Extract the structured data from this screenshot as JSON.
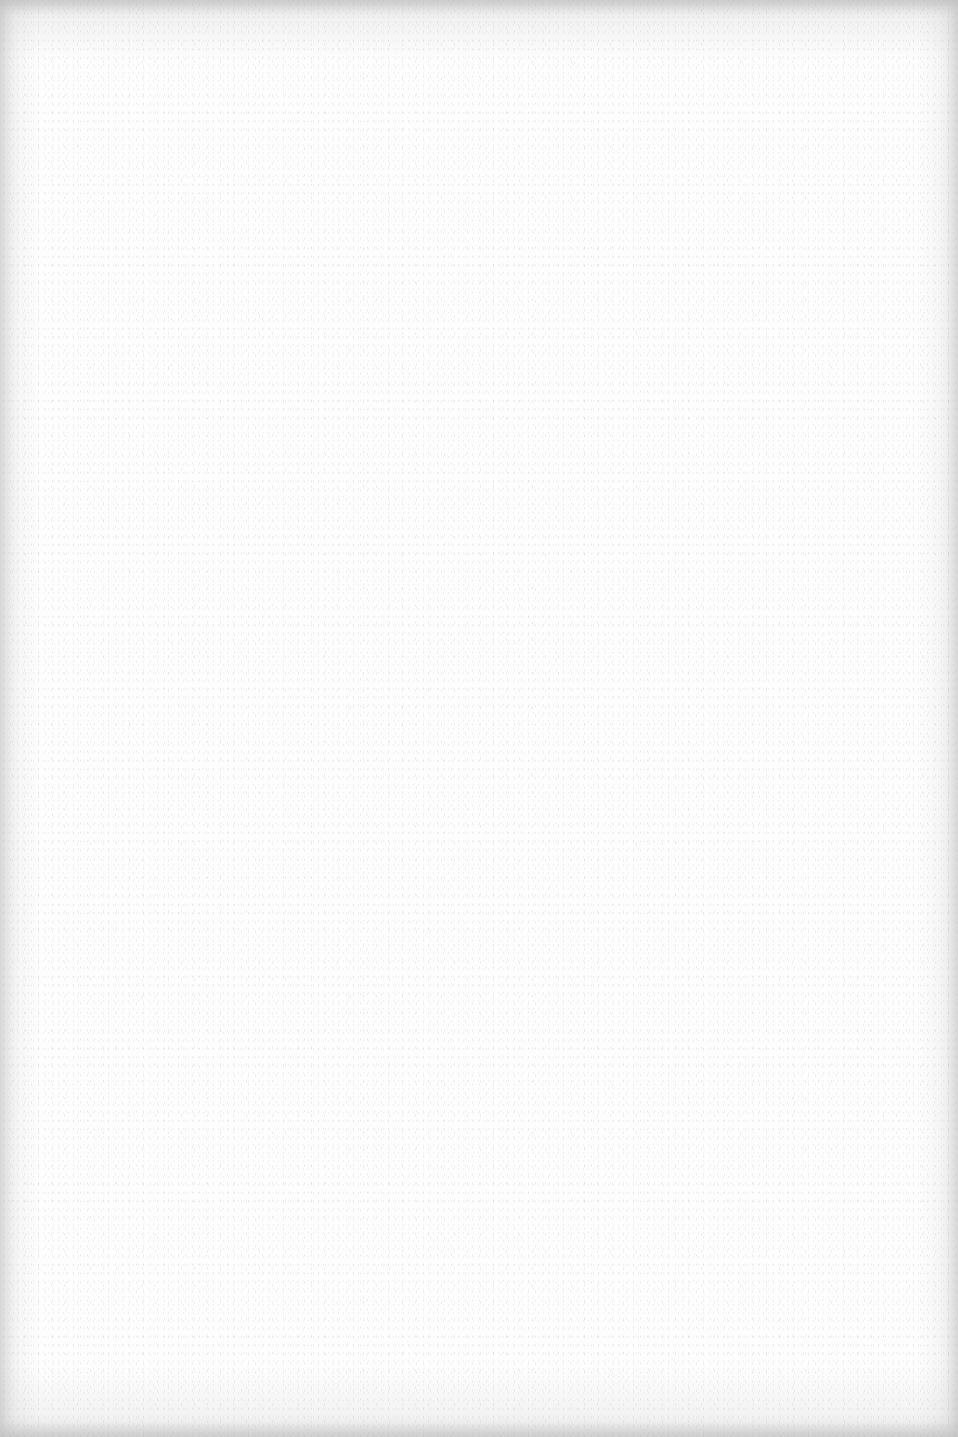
{
  "page": {
    "type": "blank-scanned-page",
    "background_color": "#fdfdfd",
    "edge_shadow_color": "#c8c8c8",
    "text": ""
  }
}
